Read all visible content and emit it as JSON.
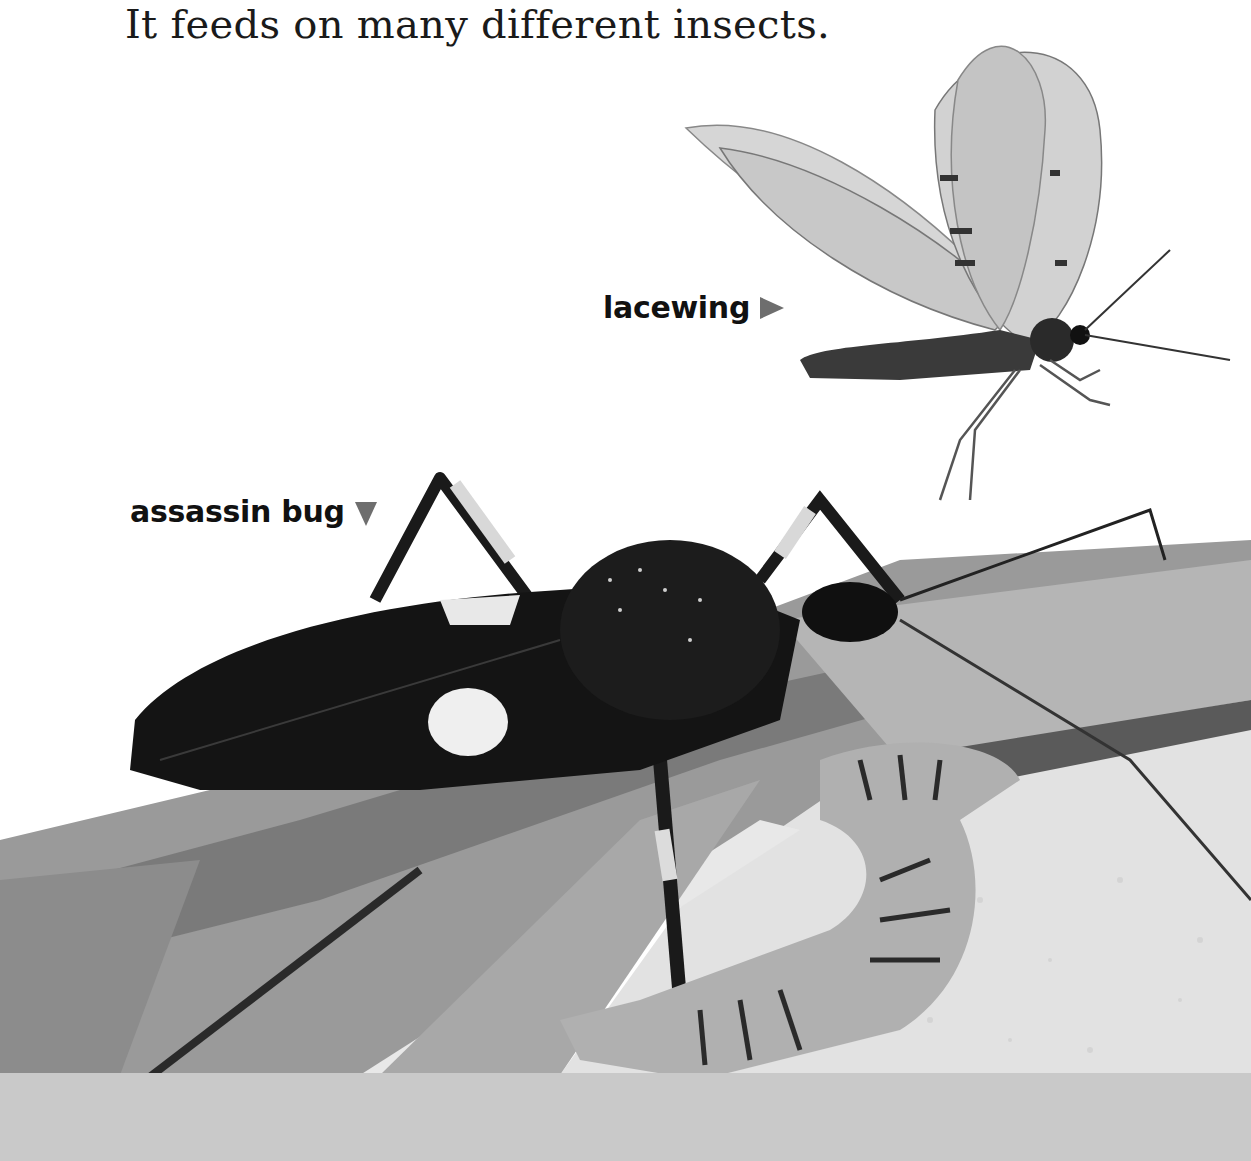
{
  "page": {
    "body_text": "It feeds on many different insects."
  },
  "labels": {
    "lacewing": {
      "text": "lacewing",
      "pointer": "right-triangle-icon"
    },
    "assassin_bug": {
      "text": "assassin bug",
      "pointer": "down-triangle-icon"
    }
  },
  "illustration": {
    "subjects": [
      "lacewing",
      "assassin bug",
      "caterpillar",
      "leaves",
      "sand"
    ],
    "colors": {
      "background": "#ffffff",
      "bottom_band": "#c9c9c9",
      "pointer": "#6e6e6e"
    }
  }
}
